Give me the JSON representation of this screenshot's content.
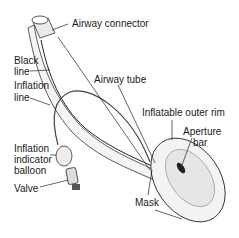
{
  "diagram": {
    "labels": {
      "airway_connector": "Airway connector",
      "black_line_1": "Black",
      "black_line_2": "line",
      "inflation_line_1": "Inflation",
      "inflation_line_2": "line",
      "airway_tube": "Airway tube",
      "inflatable_outer_rim": "Inflatable outer rim",
      "aperture_bar_1": "Aperture",
      "aperture_bar_2": "bar",
      "balloon_1": "Inflation",
      "balloon_2": "indicator",
      "balloon_3": "balloon",
      "valve": "Valve",
      "mask": "Mask"
    },
    "colors": {
      "line": "#1a1a1a",
      "fill": "#f2f2f2",
      "shade": "#c8c8c8"
    }
  }
}
